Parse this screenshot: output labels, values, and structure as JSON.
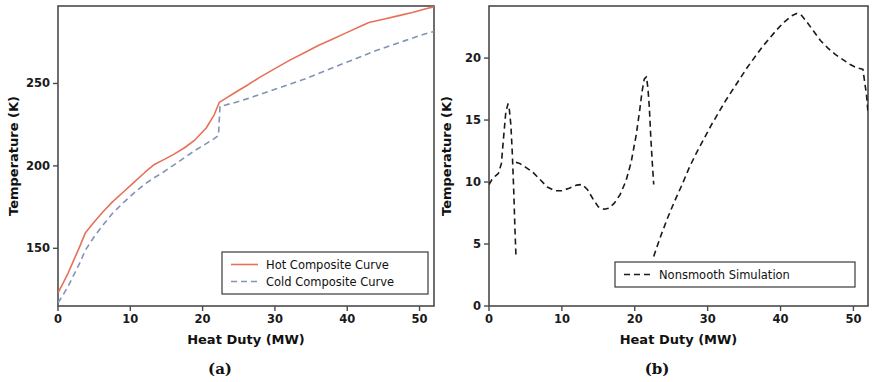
{
  "figure": {
    "panel_a_caption": "(a)",
    "panel_b_caption": "(b)"
  },
  "chart_data": [
    {
      "id": "panel-a",
      "type": "line",
      "title": "",
      "xlabel": "Heat Duty (MW)",
      "ylabel": "Temperature (K)",
      "xlim": [
        0,
        52
      ],
      "ylim": [
        115,
        297
      ],
      "xticks": [
        0,
        10,
        20,
        30,
        40,
        50
      ],
      "xticklabels": [
        "0",
        "10",
        "20",
        "30",
        "40",
        "50"
      ],
      "yticks": [
        150,
        200,
        250
      ],
      "yticklabels": [
        "150",
        "200",
        "250"
      ],
      "grid": false,
      "legend_position": "lower right",
      "series": [
        {
          "name": "Hot Composite Curve",
          "color": "#e8705a",
          "linestyle": "solid",
          "linewidth": 1.6,
          "x": [
            0.0,
            0.6,
            1.4,
            2.2,
            3.0,
            3.8,
            5.0,
            6.2,
            7.5,
            9.0,
            10.5,
            12.0,
            13.2,
            14.5,
            16.0,
            17.5,
            19.0,
            20.5,
            21.6,
            22.3,
            23.2,
            24.5,
            26.0,
            28.0,
            30.0,
            32.0,
            34.0,
            36.0,
            38.0,
            40.0,
            42.0,
            43.0,
            45.0,
            47.0,
            49.0,
            51.0,
            52.0
          ],
          "y": [
            123.0,
            128.0,
            135.0,
            143.0,
            151.0,
            159.5,
            166.0,
            172.0,
            178.0,
            184.0,
            190.0,
            196.0,
            200.5,
            203.5,
            207.0,
            211.0,
            216.0,
            223.0,
            231.0,
            238.5,
            241.0,
            244.5,
            248.5,
            254.0,
            259.0,
            264.0,
            268.5,
            273.0,
            277.0,
            281.0,
            285.0,
            287.0,
            289.0,
            291.0,
            293.0,
            295.5,
            296.5
          ]
        },
        {
          "name": "Cold Composite Curve",
          "color": "#8292b8",
          "linestyle": "dashed",
          "linewidth": 1.6,
          "x": [
            0.0,
            0.6,
            1.4,
            2.2,
            3.0,
            3.8,
            5.0,
            6.2,
            7.5,
            9.0,
            10.5,
            12.0,
            13.2,
            14.5,
            16.0,
            17.5,
            19.0,
            20.5,
            21.6,
            22.2,
            22.4,
            23.2,
            24.5,
            26.0,
            28.0,
            30.0,
            32.0,
            34.0,
            36.0,
            38.0,
            40.0,
            42.0,
            44.0,
            46.0,
            48.0,
            50.0,
            51.5,
            52.0
          ],
          "y": [
            117.0,
            121.0,
            127.0,
            134.0,
            141.0,
            149.0,
            157.0,
            164.0,
            171.0,
            177.5,
            183.5,
            189.0,
            192.5,
            196.0,
            200.5,
            205.0,
            209.5,
            213.5,
            216.5,
            218.5,
            236.0,
            237.0,
            238.5,
            240.5,
            243.5,
            246.5,
            249.5,
            252.5,
            256.0,
            259.5,
            263.0,
            266.5,
            270.0,
            273.0,
            276.0,
            279.0,
            281.0,
            281.5
          ]
        }
      ]
    },
    {
      "id": "panel-b",
      "type": "line",
      "title": "",
      "xlabel": "Heat Duty (MW)",
      "ylabel": "Temperature (K)",
      "xlim": [
        0,
        52
      ],
      "ylim": [
        0,
        24.2
      ],
      "xticks": [
        0,
        10,
        20,
        30,
        40,
        50
      ],
      "xticklabels": [
        "0",
        "10",
        "20",
        "30",
        "40",
        "50"
      ],
      "yticks": [
        0,
        5,
        10,
        15,
        20
      ],
      "yticklabels": [
        "0",
        "5",
        "10",
        "15",
        "20"
      ],
      "grid": false,
      "legend_position": "lower right",
      "series": [
        {
          "name": "Nonsmooth Simulation",
          "color": "#1a1a1a",
          "linestyle": "dashed",
          "linewidth": 1.6,
          "segments": [
            {
              "x": [
                0.0,
                0.4,
                0.9,
                1.3,
                1.7,
                2.0,
                2.3,
                2.6,
                2.8,
                3.0,
                3.2,
                3.4,
                3.55,
                3.7
              ],
              "y": [
                9.8,
                10.2,
                10.5,
                10.7,
                11.5,
                13.6,
                15.6,
                16.3,
                15.8,
                14.6,
                12.3,
                9.2,
                6.4,
                4.0
              ]
            },
            {
              "x": [
                3.7,
                4.2,
                5.0,
                6.0,
                7.0,
                8.0,
                9.0,
                10.0,
                11.0,
                12.0,
                12.8,
                13.5,
                14.3,
                15.0,
                15.8,
                16.5,
                17.2,
                18.0,
                18.8,
                19.5,
                20.2,
                20.7,
                21.0,
                21.3,
                21.6,
                21.8,
                22.0,
                22.2,
                22.4,
                22.6
              ],
              "y": [
                11.6,
                11.5,
                11.2,
                10.8,
                10.2,
                9.6,
                9.3,
                9.3,
                9.5,
                9.75,
                9.8,
                9.4,
                8.6,
                8.0,
                7.8,
                7.9,
                8.3,
                9.0,
                10.1,
                11.6,
                13.8,
                15.9,
                17.3,
                18.3,
                18.5,
                17.6,
                16.0,
                13.6,
                11.6,
                9.8
              ]
            },
            {
              "x": [
                22.6,
                23.0,
                23.6,
                24.5,
                25.5,
                26.5,
                27.5,
                28.5,
                29.5,
                30.5,
                31.5,
                32.5,
                33.5,
                34.5,
                35.5,
                36.5,
                37.5,
                38.5,
                39.5,
                40.5,
                41.5,
                42.2,
                42.8,
                43.5,
                44.5,
                45.5,
                46.5,
                47.5,
                48.5,
                49.5,
                50.5,
                51.3,
                51.8,
                52.0
              ],
              "y": [
                4.0,
                4.7,
                5.7,
                7.1,
                8.5,
                9.8,
                11.2,
                12.4,
                13.5,
                14.6,
                15.6,
                16.6,
                17.5,
                18.4,
                19.3,
                20.1,
                20.9,
                21.6,
                22.3,
                22.9,
                23.4,
                23.6,
                23.5,
                23.0,
                22.2,
                21.4,
                20.8,
                20.3,
                19.9,
                19.5,
                19.2,
                19.1,
                17.0,
                15.6
              ]
            }
          ]
        }
      ]
    }
  ]
}
